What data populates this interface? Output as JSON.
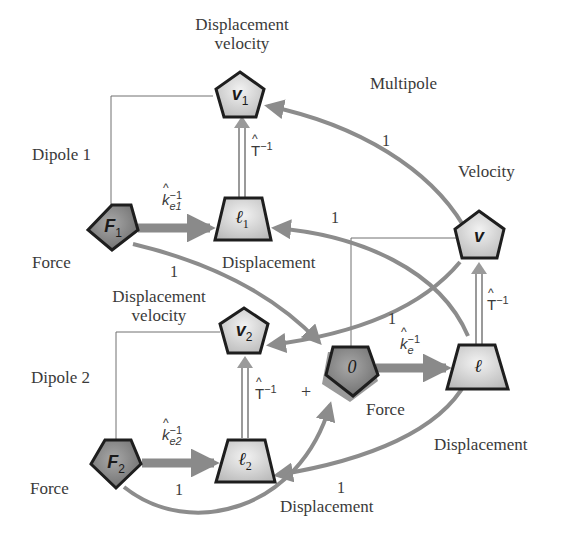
{
  "diagram": {
    "type": "flow-network",
    "groups": {
      "dipole1": "Dipole 1",
      "dipole2": "Dipole 2",
      "multipole": "Multipole"
    },
    "nodes": {
      "F1": {
        "symbol": "F",
        "subscript": "1",
        "shape": "pentagon",
        "role": "Force"
      },
      "l1": {
        "symbol": "ℓ",
        "subscript": "1",
        "shape": "trapezoid",
        "role": "Displacement"
      },
      "v1": {
        "symbol": "v",
        "subscript": "1",
        "shape": "pentagon",
        "role": "Displacement velocity"
      },
      "F2": {
        "symbol": "F",
        "subscript": "2",
        "shape": "pentagon",
        "role": "Force"
      },
      "l2": {
        "symbol": "ℓ",
        "subscript": "2",
        "shape": "trapezoid",
        "role": "Displacement"
      },
      "v2": {
        "symbol": "v",
        "subscript": "2",
        "shape": "pentagon",
        "role": "Displacement velocity"
      },
      "zero": {
        "symbol": "0",
        "subscript": "",
        "shape": "pentagon",
        "role": "Force"
      },
      "l": {
        "symbol": "ℓ",
        "subscript": "",
        "shape": "trapezoid",
        "role": "Displacement"
      },
      "v": {
        "symbol": "v",
        "subscript": "",
        "shape": "pentagon",
        "role": "Velocity"
      }
    },
    "labels": {
      "disp_velocity_1_line1": "Displacement",
      "disp_velocity_1_line2": "velocity",
      "dipole1": "Dipole 1",
      "force_1": "Force",
      "displacement_1": "Displacement",
      "disp_velocity_2_line1": "Displacement",
      "disp_velocity_2_line2": "velocity",
      "dipole2": "Dipole 2",
      "force_2": "Force",
      "displacement_2": "Displacement",
      "multipole": "Multipole",
      "velocity": "Velocity",
      "force_0": "Force",
      "displacement": "Displacement",
      "plus": "+"
    },
    "edge_labels": {
      "ke1_base": "k",
      "ke1_sub": "e1",
      "ke1_sup": "−1",
      "ke2_base": "k",
      "ke2_sub": "e2",
      "ke2_sup": "−1",
      "ke_base": "k",
      "ke_sub": "e",
      "ke_sup": "−1",
      "T_base": "T",
      "T_sup": "−1",
      "one": "1"
    },
    "edges": [
      {
        "from": "F1",
        "to": "l1",
        "label": "k̂e1⁻¹"
      },
      {
        "from": "l1",
        "to": "v1",
        "label": "T̂⁻¹"
      },
      {
        "from": "F2",
        "to": "l2",
        "label": "k̂e2⁻¹"
      },
      {
        "from": "l2",
        "to": "v2",
        "label": "T̂⁻¹"
      },
      {
        "from": "zero",
        "to": "l",
        "label": "k̂e⁻¹"
      },
      {
        "from": "l",
        "to": "v",
        "label": "T̂⁻¹"
      },
      {
        "from": "v",
        "to": "v1",
        "label": "1"
      },
      {
        "from": "v",
        "to": "v2",
        "label": "1"
      },
      {
        "from": "l",
        "to": "l1",
        "label": "1"
      },
      {
        "from": "l",
        "to": "l2",
        "label": "1"
      },
      {
        "from": "F1",
        "to": "zero",
        "label": "1"
      },
      {
        "from": "F2",
        "to": "zero",
        "label": "1"
      }
    ],
    "colors": {
      "node_fill_light": "#d6d6d6",
      "node_fill_dark": "#8a8a8a",
      "node_stroke": "#1e1e1e",
      "arrow": "#8c8c8c",
      "thin_line": "#6e6e6e",
      "text": "#3a3a3a"
    }
  }
}
